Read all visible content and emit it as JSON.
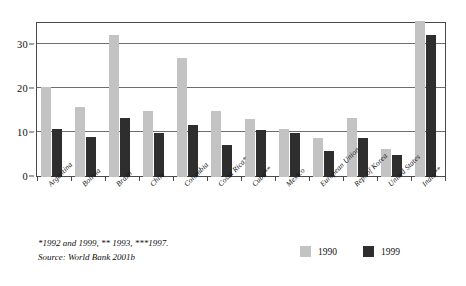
{
  "chart_data": {
    "type": "bar",
    "title": "",
    "subtitle": "",
    "xlabel": "",
    "ylabel": "",
    "ylim": [
      0,
      35
    ],
    "yticks": [
      0,
      10,
      20,
      30
    ],
    "grid": true,
    "legend_position": "bottom-right",
    "categories": [
      "Argentina",
      "Bolivia",
      "Brazil",
      "Chile",
      "Colombia",
      "Costa Rica*",
      "Cuba**",
      "Mexico",
      "European Union",
      "Rep. of Korea",
      "United States",
      "India**"
    ],
    "series": [
      {
        "name": "1990",
        "color": "#c3c3c3",
        "values": [
          20.4,
          16.0,
          32.2,
          15.0,
          27.0,
          15.0,
          13.2,
          11.0,
          8.8,
          13.3,
          6.4,
          35.5
        ]
      },
      {
        "name": "1999",
        "color": "#2e2e2e",
        "values": [
          11.0,
          9.0,
          13.5,
          10.1,
          11.8,
          7.2,
          10.7,
          10.1,
          5.8,
          8.9,
          5.0,
          32.3
        ]
      }
    ],
    "footnotes": [
      "*1992 and 1999, ** 1993, ***1997.",
      "Source: World Bank 2001b"
    ]
  },
  "legend": {
    "entries": [
      {
        "label": "1990",
        "swatch_name": "legend-swatch-1990"
      },
      {
        "label": "1999",
        "swatch_name": "legend-swatch-1999"
      }
    ]
  },
  "colors": {
    "series_1990": "#c3c3c3",
    "series_1999": "#2e2e2e",
    "axis": "#4a4a4a",
    "gridline": "#6e6e6e",
    "background": "#ffffff",
    "text": "#111111"
  }
}
